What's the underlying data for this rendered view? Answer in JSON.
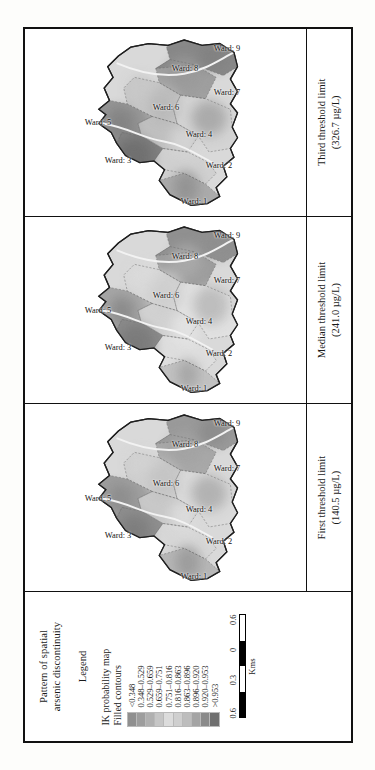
{
  "figure": {
    "orientation": "rotated-90",
    "legend": {
      "title_line1": "Pattern of spatial",
      "title_line2": "arsenic discontinuity",
      "legend_word": "Legend",
      "sub_line1": "IK probability map",
      "sub_line2": "Filled contours",
      "classes": [
        {
          "label": "<0.348",
          "color": "#8f8f8f"
        },
        {
          "label": "0.348–0.529",
          "color": "#9d9d9d"
        },
        {
          "label": "0.529–0.659",
          "color": "#b0b0b0"
        },
        {
          "label": "0.659–0.751",
          "color": "#c6c6c6"
        },
        {
          "label": "0.751–0.816",
          "color": "#dcdcdc"
        },
        {
          "label": "0.816–0.863",
          "color": "#cfcfcf"
        },
        {
          "label": "0.863–0.896",
          "color": "#bdbdbd"
        },
        {
          "label": "0.896–0.920",
          "color": "#a4a4a4"
        },
        {
          "label": "0.920–0.953",
          "color": "#8a8a8a"
        },
        {
          "label": ">0.953",
          "color": "#6f6f6f"
        }
      ],
      "scalebar": {
        "ticks": [
          "0.6",
          "0.3",
          "0",
          "0.6"
        ],
        "unit": "Kms",
        "segments": [
          "dark",
          "light",
          "dark",
          "light"
        ]
      }
    },
    "panels": [
      {
        "id": "panel-first",
        "caption_line1": "First threshold limit",
        "caption_line2": "(140.5 µg/L)",
        "wards": [
          "Ward: 1",
          "Ward: 2",
          "Ward: 3",
          "Ward: 4",
          "Ward: 5",
          "Ward: 6",
          "Ward: 7",
          "Ward: 8",
          "Ward: 9"
        ]
      },
      {
        "id": "panel-median",
        "caption_line1": "Median threshold limit",
        "caption_line2": "(241.0 µg/L)",
        "wards": [
          "Ward: 1",
          "Ward: 2",
          "Ward: 3",
          "Ward: 4",
          "Ward: 5",
          "Ward: 6",
          "Ward: 7",
          "Ward: 8",
          "Ward: 9"
        ]
      },
      {
        "id": "panel-third",
        "caption_line1": "Third threshold limit",
        "caption_line2": "(326.7 µg/L)",
        "wards": [
          "Ward: 1",
          "Ward: 2",
          "Ward: 3",
          "Ward: 4",
          "Ward: 5",
          "Ward: 6",
          "Ward: 7",
          "Ward: 8",
          "Ward: 9"
        ]
      }
    ],
    "ward_positions": [
      {
        "x": 8,
        "y": 60
      },
      {
        "x": 27,
        "y": 69
      },
      {
        "x": 30,
        "y": 33
      },
      {
        "x": 44,
        "y": 62
      },
      {
        "x": 50,
        "y": 26
      },
      {
        "x": 58,
        "y": 50
      },
      {
        "x": 66,
        "y": 72
      },
      {
        "x": 79,
        "y": 57
      },
      {
        "x": 90,
        "y": 72
      }
    ]
  }
}
